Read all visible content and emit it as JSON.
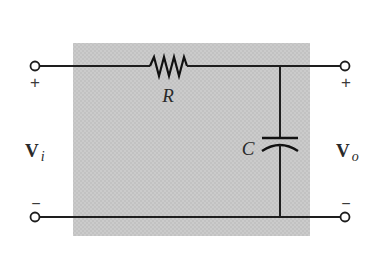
{
  "diagram": {
    "type": "RC low-pass filter circuit",
    "background_box_color": "#c8c8c8",
    "wire_color": "#1e1e1e",
    "components": {
      "resistor": {
        "label": "R"
      },
      "capacitor": {
        "label": "C"
      }
    },
    "input": {
      "voltage_symbol": "V",
      "voltage_subscript": "i",
      "plus_sign": "+",
      "minus_sign": "−"
    },
    "output": {
      "voltage_symbol": "V",
      "voltage_subscript": "o",
      "plus_sign": "+",
      "minus_sign": "−"
    }
  }
}
